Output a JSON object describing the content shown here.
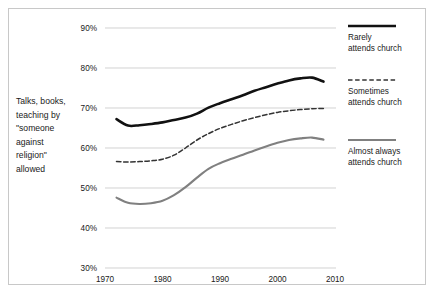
{
  "chart_data": {
    "type": "line",
    "title": "",
    "subtitle": "",
    "xlabel": "",
    "ylabel": "",
    "side_label": "Talks, books, teaching by \"someone against religion\" allowed",
    "side_label_lines": [
      "Talks, books,",
      "teaching by",
      "\"someone",
      "against",
      "religion\"",
      "allowed"
    ],
    "xlim": [
      1970,
      2010
    ],
    "ylim": [
      30,
      90
    ],
    "x_ticks": [
      1970,
      1980,
      1990,
      2000,
      2010
    ],
    "x_tick_labels": [
      "1970",
      "1980",
      "1990",
      "2000",
      "2010"
    ],
    "y_ticks": [
      30,
      40,
      50,
      60,
      70,
      80,
      90
    ],
    "y_tick_labels": [
      "30%",
      "40%",
      "50%",
      "60%",
      "70%",
      "80%",
      "90%"
    ],
    "grid": true,
    "grid_axis": "y",
    "legend_position": "right",
    "series": [
      {
        "name": "Rarely attends church",
        "name_lines": [
          "Rarely",
          "attends church"
        ],
        "style": "solid",
        "color": "#111111",
        "width": 2.6,
        "x": [
          1972,
          1974,
          1976,
          1978,
          1980,
          1982,
          1984,
          1986,
          1988,
          1990,
          1992,
          1994,
          1996,
          1998,
          2000,
          2002,
          2004,
          2006,
          2008
        ],
        "values": [
          67.2,
          65.6,
          65.7,
          66.0,
          66.4,
          67.0,
          67.6,
          68.6,
          70.1,
          71.2,
          72.2,
          73.2,
          74.3,
          75.2,
          76.1,
          76.9,
          77.4,
          77.6,
          76.6
        ]
      },
      {
        "name": "Sometimes attends church",
        "name_lines": [
          "Sometimes",
          "attends church"
        ],
        "style": "dashed",
        "color": "#333333",
        "width": 1.5,
        "x": [
          1972,
          1974,
          1976,
          1978,
          1980,
          1982,
          1984,
          1986,
          1988,
          1990,
          1992,
          1994,
          1996,
          1998,
          2000,
          2002,
          2004,
          2006,
          2008
        ],
        "values": [
          56.6,
          56.5,
          56.6,
          56.8,
          57.2,
          58.2,
          60.0,
          62.0,
          63.6,
          64.9,
          65.9,
          66.8,
          67.6,
          68.3,
          68.9,
          69.3,
          69.6,
          69.8,
          69.9
        ]
      },
      {
        "name": "Almost always attends church",
        "name_lines": [
          "Almost always",
          "attends church"
        ],
        "style": "solid",
        "color": "#808080",
        "width": 2.1,
        "x": [
          1972,
          1974,
          1976,
          1978,
          1980,
          1982,
          1984,
          1986,
          1988,
          1990,
          1992,
          1994,
          1996,
          1998,
          2000,
          2002,
          2004,
          2006,
          2008
        ],
        "values": [
          47.6,
          46.3,
          46.0,
          46.2,
          46.8,
          48.2,
          50.2,
          52.6,
          54.8,
          56.2,
          57.3,
          58.3,
          59.4,
          60.4,
          61.3,
          62.0,
          62.4,
          62.6,
          62.1
        ]
      }
    ]
  }
}
